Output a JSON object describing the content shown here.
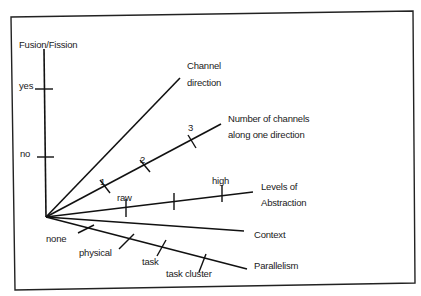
{
  "diagram": {
    "colors": {
      "line": "#111111",
      "border": "#222222",
      "background": "#ffffff",
      "text": "#1a1a1a"
    },
    "axes": {
      "fusion_fission": {
        "label": "Fusion/Fission",
        "ticks": [
          "yes",
          "no"
        ]
      },
      "channel_direction": {
        "label_line1": "Channel",
        "label_line2": "direction"
      },
      "number_of_channels": {
        "label_line1": "Number of channels",
        "label_line2": "along one direction",
        "ticks": [
          "1",
          "2",
          "3"
        ]
      },
      "levels_of_abstraction": {
        "label_line1": "Levels of",
        "label_line2": "Abstraction",
        "ticks": [
          "raw",
          "",
          "high"
        ]
      },
      "context": {
        "label": "Context"
      },
      "parallelism": {
        "label": "Parallelism",
        "ticks": [
          "none",
          "physical",
          "task",
          "task cluster"
        ]
      }
    }
  }
}
